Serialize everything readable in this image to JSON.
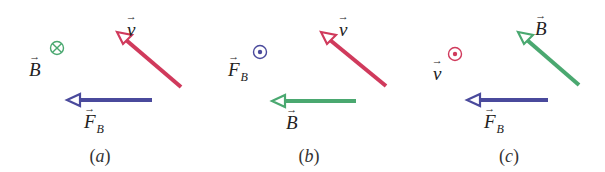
{
  "colors": {
    "velocity": "#d03a5c",
    "field": "#4aa870",
    "force": "#4a4a9c",
    "text": "#222222"
  },
  "panels": [
    {
      "caption": "a",
      "diagonal_arrow": {
        "quantity": "v",
        "label": "v",
        "color": "#d03a5c",
        "tip": [
          117,
          32
        ],
        "tail": [
          181,
          87
        ]
      },
      "horizontal_arrow": {
        "quantity": "F_B",
        "label": "F",
        "sub": "B",
        "color": "#4a4a9c",
        "tip": [
          67,
          100
        ],
        "tail": [
          152,
          100
        ]
      },
      "out_of_plane": {
        "quantity": "B",
        "label": "B",
        "symbol": "into-page",
        "color": "#4aa870",
        "center": [
          57,
          48
        ]
      }
    },
    {
      "caption": "b",
      "diagonal_arrow": {
        "quantity": "v",
        "label": "v",
        "color": "#d03a5c",
        "tip": [
          321,
          32
        ],
        "tail": [
          386,
          86
        ]
      },
      "horizontal_arrow": {
        "quantity": "B",
        "label": "B",
        "color": "#4aa870",
        "tip": [
          272,
          101
        ],
        "tail": [
          356,
          101
        ]
      },
      "out_of_plane": {
        "quantity": "F_B",
        "label": "F",
        "sub": "B",
        "symbol": "out-of-page",
        "color": "#4a4a9c",
        "center": [
          260,
          52
        ]
      }
    },
    {
      "caption": "c",
      "diagonal_arrow": {
        "quantity": "B",
        "label": "B",
        "color": "#4aa870",
        "tip": [
          518,
          32
        ],
        "tail": [
          579,
          85
        ]
      },
      "horizontal_arrow": {
        "quantity": "F_B",
        "label": "F",
        "sub": "B",
        "color": "#4a4a9c",
        "tip": [
          467,
          100
        ],
        "tail": [
          548,
          100
        ]
      },
      "out_of_plane": {
        "quantity": "v",
        "label": "v",
        "symbol": "out-of-page",
        "color": "#d03a5c",
        "center": [
          455,
          54
        ]
      }
    }
  ],
  "labels": {
    "a_v": "v",
    "a_B": "B",
    "a_F": "F",
    "a_F_sub": "B",
    "b_v": "v",
    "b_B": "B",
    "b_F": "F",
    "b_F_sub": "B",
    "c_B": "B",
    "c_v": "v",
    "c_F": "F",
    "c_F_sub": "B",
    "vec_arrow": "→",
    "cap_a": "a",
    "cap_b": "b",
    "cap_c": "c",
    "paren_open": "(",
    "paren_close": ")"
  }
}
